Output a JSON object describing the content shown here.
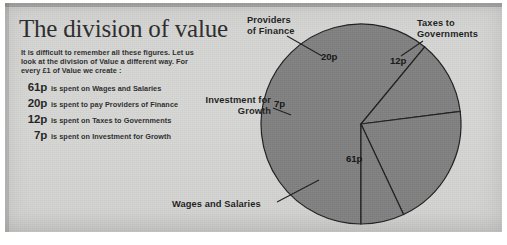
{
  "page": {
    "title": "The division of value",
    "intro": "It is difficult to remember all these figures. Let us look at the division of Value a different way. For every £1 of Value we create :",
    "bullets": [
      {
        "amount": "61p",
        "text": "is spent on Wages and Salaries"
      },
      {
        "amount": "20p",
        "text": "is spent to pay Providers of Finance"
      },
      {
        "amount": "12p",
        "text": "is spent on Taxes to Governments"
      },
      {
        "amount": "7p",
        "text": "is spent on Investment for Growth"
      }
    ]
  },
  "labels": {
    "providers": "Providers\nof Finance",
    "providers_l1": "Providers",
    "providers_l2": "of Finance",
    "taxes_l1": "Taxes to",
    "taxes_l2": "Governments",
    "investment_l1": "Investment for",
    "investment_l2": "Growth",
    "wages": "Wages and Salaries"
  },
  "colors": {
    "paper": "#d4d5d3",
    "slice": "#7f7f7f",
    "slice_edge": "#1d1d1d",
    "ink": "#1f1f1f"
  },
  "chart_data": {
    "type": "pie",
    "title": "The division of value",
    "unit": "pence per £1 of Value created",
    "total": 100,
    "categories": [
      "Wages and Salaries",
      "Providers of Finance",
      "Taxes to Governments",
      "Investment for Growth"
    ],
    "values": [
      61,
      20,
      12,
      7
    ],
    "labels": [
      "61p",
      "20p",
      "12p",
      "7p"
    ],
    "start_angle_deg": 180,
    "direction": "clockwise",
    "legend": "none",
    "grid": false,
    "slices": [
      {
        "name": "Wages and Salaries",
        "value": 61,
        "label": "61p",
        "start_deg": 180.0,
        "end_deg": 399.6,
        "callout": "Wages and Salaries"
      },
      {
        "name": "Taxes to Governments",
        "value": 12,
        "label": "12p",
        "start_deg": 39.6,
        "end_deg": 82.8,
        "callout": "Taxes to Governments"
      },
      {
        "name": "Providers of Finance",
        "value": 20,
        "label": "20p",
        "start_deg": 82.8,
        "end_deg": 154.8,
        "callout": "Providers of Finance"
      },
      {
        "name": "Investment for Growth",
        "value": 7,
        "label": "7p",
        "start_deg": 154.8,
        "end_deg": 180.0,
        "callout": "Investment for Growth"
      }
    ]
  }
}
